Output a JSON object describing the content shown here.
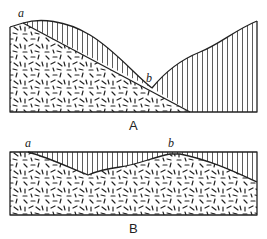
{
  "figure": {
    "panels": [
      {
        "id": "A",
        "caption": "A",
        "points": [
          {
            "label": "a"
          },
          {
            "label": "b"
          }
        ],
        "legend": {
          "hatched": "vertical-line hatching (upper layer)",
          "speckled": "dash-speckle texture (lower layer)"
        }
      },
      {
        "id": "B",
        "caption": "B",
        "points": [
          {
            "label": "a"
          },
          {
            "label": "b"
          }
        ]
      }
    ],
    "colors": {
      "line": "#222222",
      "background": "#ffffff"
    }
  }
}
